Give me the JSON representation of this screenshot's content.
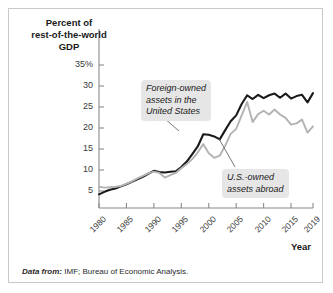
{
  "figure": {
    "y_axis_title": "Percent of\nrest-of-the-world\nGDP",
    "y_axis_title_line1": "Percent of",
    "y_axis_title_line2": "rest-of-the-world",
    "y_axis_title_line3": "GDP",
    "x_axis_title": "Year",
    "source_lead": "Data from:",
    "source_text": " IMF; Bureau of Economic Analysis.",
    "annotation_foreign_line1": "Foreign-owned",
    "annotation_foreign_line2": "assets in the",
    "annotation_foreign_line3": "United States",
    "annotation_usowned_line1": "U.S.-owned",
    "annotation_usowned_line2": "assets abroad"
  },
  "colors": {
    "series_foreign": "#1a1a1a",
    "series_usowned": "#b3b3b3",
    "axis": "#8a8a8a",
    "frame_border": "#c9c9c9",
    "annotation_background": "#e6e6e6",
    "text": "#1a1a1a",
    "background": "#ffffff"
  },
  "chart_data": {
    "type": "line",
    "title": "",
    "subtitle": "",
    "xlabel": "Year",
    "ylabel": "Percent of rest-of-the-world GDP",
    "xlim": [
      1980,
      2019
    ],
    "ylim": [
      0,
      37
    ],
    "grid": false,
    "legend_position": "inline-annotations",
    "x_ticks": [
      1980,
      1985,
      1990,
      1995,
      2000,
      2005,
      2010,
      2015,
      2019
    ],
    "x_tick_labels": [
      "1980",
      "1985",
      "1990",
      "1995",
      "2000",
      "2005",
      "2010",
      "2015",
      "2019"
    ],
    "y_ticks": [
      5,
      10,
      15,
      20,
      25,
      30,
      35
    ],
    "y_tick_labels": [
      "5",
      "10",
      "15",
      "20",
      "25",
      "30",
      "35%"
    ],
    "x": [
      1980,
      1981,
      1982,
      1983,
      1984,
      1985,
      1986,
      1987,
      1988,
      1989,
      1990,
      1991,
      1992,
      1993,
      1994,
      1995,
      1996,
      1997,
      1998,
      1999,
      2000,
      2001,
      2002,
      2003,
      2004,
      2005,
      2006,
      2007,
      2008,
      2009,
      2010,
      2011,
      2012,
      2013,
      2014,
      2015,
      2016,
      2017,
      2018,
      2019
    ],
    "series": [
      {
        "name": "Foreign-owned assets in the United States",
        "color": "#1a1a1a",
        "values": [
          4.2,
          4.8,
          5.3,
          5.6,
          6.1,
          6.6,
          7.2,
          7.8,
          8.4,
          9.1,
          9.8,
          9.5,
          9.4,
          9.6,
          9.7,
          10.7,
          12.0,
          13.8,
          15.6,
          18.5,
          18.4,
          18.0,
          17.3,
          19.5,
          21.6,
          23.0,
          25.7,
          27.8,
          26.9,
          27.9,
          27.1,
          27.8,
          28.2,
          27.2,
          28.2,
          27.0,
          27.6,
          27.9,
          26.1,
          28.3
        ]
      },
      {
        "name": "U.S.-owned assets abroad",
        "color": "#b3b3b3",
        "values": [
          6.0,
          5.8,
          5.9,
          6.0,
          6.2,
          6.7,
          7.3,
          8.0,
          8.6,
          9.2,
          9.6,
          9.3,
          8.2,
          8.8,
          9.3,
          10.4,
          11.4,
          12.6,
          14.2,
          16.2,
          14.0,
          12.9,
          13.4,
          15.8,
          18.6,
          19.8,
          23.0,
          26.2,
          21.4,
          23.3,
          24.1,
          23.2,
          24.4,
          23.2,
          22.4,
          20.8,
          21.1,
          22.0,
          18.9,
          20.4
        ]
      }
    ],
    "annotations": [
      {
        "text": "Foreign-owned assets in the United States",
        "points_to_series": "Foreign-owned assets in the United States",
        "points_to_year": 2000
      },
      {
        "text": "U.S.-owned assets abroad",
        "points_to_series": "U.S.-owned assets abroad",
        "points_to_year": 2005
      }
    ]
  }
}
